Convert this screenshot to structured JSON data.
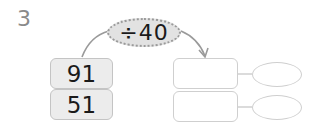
{
  "problem": {
    "number": "3",
    "operation": "÷40",
    "dividends": [
      "91",
      "51"
    ],
    "quotient_boxes": [
      "",
      ""
    ],
    "remainder_boxes": [
      "",
      ""
    ]
  },
  "colors": {
    "number_label": "#8a8a8a",
    "operation_fill": "#e2e2e2",
    "box_fill": "#ececec",
    "outline": "#cfcfcf"
  }
}
